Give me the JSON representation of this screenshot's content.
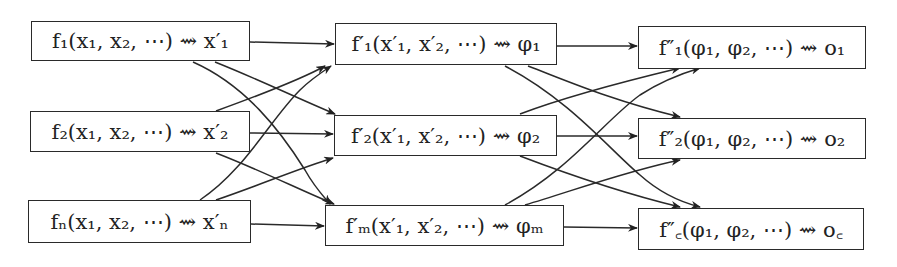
{
  "diagram": {
    "columns": [
      {
        "nodes": [
          {
            "id": "c1n1",
            "label": "f₁(x₁, x₂, ⋯) ⇝ x′₁",
            "box": [
              31,
              21,
              219,
              40
            ]
          },
          {
            "id": "c1n2",
            "label": "f₂(x₁, x₂, ⋯) ⇝ x′₂",
            "box": [
              30,
              111,
              220,
              41
            ]
          },
          {
            "id": "c1n3",
            "label": "fₙ(x₁, x₂, ⋯) ⇝ x′ₙ",
            "box": [
              28,
              200,
              223,
              43
            ]
          }
        ]
      },
      {
        "nodes": [
          {
            "id": "c2n1",
            "label": "f′₁(x′₁, x′₂, ⋯) ⇝ φ₁",
            "box": [
              335,
              23,
              222,
              42
            ]
          },
          {
            "id": "c2n2",
            "label": "f′₂(x′₁, x′₂, ⋯) ⇝ φ₂",
            "box": [
              334,
              115,
              223,
              41
            ]
          },
          {
            "id": "c2n3",
            "label": "f′ₘ(x′₁, x′₂, ⋯) ⇝ φₘ",
            "box": [
              325,
              205,
              239,
              41
            ]
          }
        ]
      },
      {
        "nodes": [
          {
            "id": "c3n1",
            "label": "f″₁(φ₁, φ₂, ⋯) ⇝ o₁",
            "box": [
              638,
              26,
              228,
              43
            ]
          },
          {
            "id": "c3n2",
            "label": "f″₂(φ₁, φ₂, ⋯) ⇝ o₂",
            "box": [
              638,
              118,
              228,
              41
            ]
          },
          {
            "id": "c3n3",
            "label": "f″꜀(φ₁, φ₂, ⋯) ⇝ o꜀",
            "box": [
              638,
              208,
              226,
              42
            ]
          }
        ]
      }
    ],
    "edges_note": "Fully connected: every node in column k feeds every node in column k+1 (straight horizontal arrows between same-row nodes, crossing curved arrows otherwise)."
  }
}
